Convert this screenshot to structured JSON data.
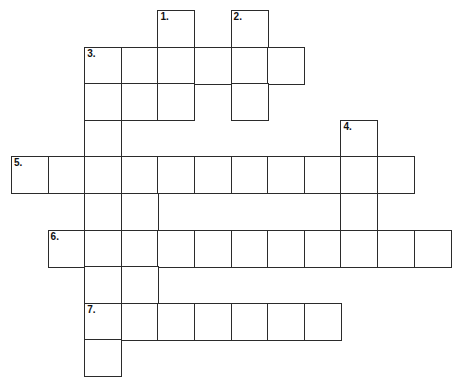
{
  "puzzle": {
    "title": "Crossword Puzzle Grid",
    "background_color": "#ffffff",
    "cell_border_color": "#2b2b2b",
    "cell_size_px": 36.6,
    "origin": {
      "x": 11,
      "y": 10
    },
    "grid_columns": 12,
    "grid_rows": 10,
    "numbers": [
      "1.",
      "2.",
      "3.",
      "4.",
      "5.",
      "6.",
      "7."
    ],
    "entries": [
      {
        "number": "1.",
        "label": "1.",
        "direction": "down",
        "start_col": 4,
        "start_row": 0,
        "length": 3
      },
      {
        "number": "2.",
        "label": "2.",
        "direction": "down",
        "start_col": 6,
        "start_row": 0,
        "length": 3
      },
      {
        "number": "3.",
        "label": "3.",
        "direction": "across",
        "start_col": 2,
        "start_row": 1,
        "length": 6
      },
      {
        "number": "3b",
        "label": "",
        "direction": "down",
        "start_col": 2,
        "start_row": 1,
        "length": 9
      },
      {
        "number": "4.",
        "label": "4.",
        "direction": "down",
        "start_col": 9,
        "start_row": 3,
        "length": 3
      },
      {
        "number": "5.",
        "label": "5.",
        "direction": "across",
        "start_col": 0,
        "start_row": 4,
        "length": 11
      },
      {
        "number": "6.",
        "label": "6.",
        "direction": "across",
        "start_col": 1,
        "start_row": 6,
        "length": 11
      },
      {
        "number": "7.",
        "label": "7.",
        "direction": "across",
        "start_col": 2,
        "start_row": 8,
        "length": 7
      },
      {
        "number": "3c",
        "label": "",
        "direction": "down",
        "start_col": 3,
        "start_row": 1,
        "length": 9
      }
    ],
    "cells": [
      {
        "col": 4,
        "row": 0,
        "num": "1."
      },
      {
        "col": 6,
        "row": 0,
        "num": "2."
      },
      {
        "col": 2,
        "row": 1,
        "num": "3."
      },
      {
        "col": 3,
        "row": 1,
        "num": ""
      },
      {
        "col": 4,
        "row": 1,
        "num": ""
      },
      {
        "col": 5,
        "row": 1,
        "num": ""
      },
      {
        "col": 6,
        "row": 1,
        "num": ""
      },
      {
        "col": 7,
        "row": 1,
        "num": ""
      },
      {
        "col": 2,
        "row": 2,
        "num": ""
      },
      {
        "col": 3,
        "row": 2,
        "num": ""
      },
      {
        "col": 4,
        "row": 2,
        "num": ""
      },
      {
        "col": 6,
        "row": 2,
        "num": ""
      },
      {
        "col": 2,
        "row": 3,
        "num": ""
      },
      {
        "col": 9,
        "row": 3,
        "num": "4."
      },
      {
        "col": 0,
        "row": 4,
        "num": "5."
      },
      {
        "col": 1,
        "row": 4,
        "num": ""
      },
      {
        "col": 2,
        "row": 4,
        "num": ""
      },
      {
        "col": 3,
        "row": 4,
        "num": ""
      },
      {
        "col": 4,
        "row": 4,
        "num": ""
      },
      {
        "col": 5,
        "row": 4,
        "num": ""
      },
      {
        "col": 6,
        "row": 4,
        "num": ""
      },
      {
        "col": 7,
        "row": 4,
        "num": ""
      },
      {
        "col": 8,
        "row": 4,
        "num": ""
      },
      {
        "col": 9,
        "row": 4,
        "num": ""
      },
      {
        "col": 10,
        "row": 4,
        "num": ""
      },
      {
        "col": 2,
        "row": 5,
        "num": ""
      },
      {
        "col": 3,
        "row": 5,
        "num": ""
      },
      {
        "col": 9,
        "row": 5,
        "num": ""
      },
      {
        "col": 1,
        "row": 6,
        "num": "6."
      },
      {
        "col": 2,
        "row": 6,
        "num": ""
      },
      {
        "col": 3,
        "row": 6,
        "num": ""
      },
      {
        "col": 4,
        "row": 6,
        "num": ""
      },
      {
        "col": 5,
        "row": 6,
        "num": ""
      },
      {
        "col": 6,
        "row": 6,
        "num": ""
      },
      {
        "col": 7,
        "row": 6,
        "num": ""
      },
      {
        "col": 8,
        "row": 6,
        "num": ""
      },
      {
        "col": 9,
        "row": 6,
        "num": ""
      },
      {
        "col": 10,
        "row": 6,
        "num": ""
      },
      {
        "col": 11,
        "row": 6,
        "num": ""
      },
      {
        "col": 2,
        "row": 7,
        "num": ""
      },
      {
        "col": 3,
        "row": 7,
        "num": ""
      },
      {
        "col": 2,
        "row": 8,
        "num": "7."
      },
      {
        "col": 3,
        "row": 8,
        "num": ""
      },
      {
        "col": 4,
        "row": 8,
        "num": ""
      },
      {
        "col": 5,
        "row": 8,
        "num": ""
      },
      {
        "col": 6,
        "row": 8,
        "num": ""
      },
      {
        "col": 7,
        "row": 8,
        "num": ""
      },
      {
        "col": 8,
        "row": 8,
        "num": ""
      },
      {
        "col": 2,
        "row": 9,
        "num": ""
      }
    ]
  }
}
